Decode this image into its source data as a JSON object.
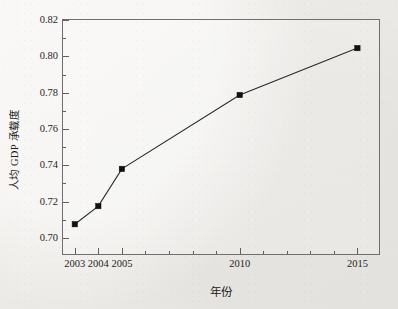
{
  "chart_data": {
    "type": "line",
    "title": "",
    "xlabel": "年份",
    "ylabel": "人均 GDP 承载度",
    "x": [
      2003,
      2004,
      2005,
      2010,
      2015
    ],
    "categories": [
      "2003",
      "2004",
      "2005",
      "2010",
      "2015"
    ],
    "values": [
      0.7075,
      0.7175,
      0.738,
      0.7787,
      0.8045
    ],
    "series": [
      {
        "name": "人均 GDP 承载度",
        "values": [
          0.7075,
          0.7175,
          0.738,
          0.7787,
          0.8045
        ]
      }
    ],
    "xlim": [
      2002.5,
      2016.0
    ],
    "ylim": [
      0.69,
      0.82
    ],
    "x_tick_labels": [
      "2003",
      "2004",
      "2005",
      "2010",
      "2015"
    ],
    "x_tick_values": [
      2003,
      2004,
      2005,
      2010,
      2015
    ],
    "y_tick_labels": [
      "0.70",
      "0.72",
      "0.74",
      "0.76",
      "0.78",
      "0.80",
      "0.82"
    ],
    "y_tick_values": [
      0.7,
      0.72,
      0.74,
      0.76,
      0.78,
      0.8,
      0.82
    ],
    "y_minor_tick_values": [
      0.71,
      0.73,
      0.75,
      0.77,
      0.79,
      0.81
    ],
    "grid": false,
    "legend": "none",
    "marker": "filled-square",
    "marker_color": "#111111",
    "line_color": "#2b2b2b",
    "background_color": "#edebe7",
    "frame_color": "#6f6f6f"
  }
}
